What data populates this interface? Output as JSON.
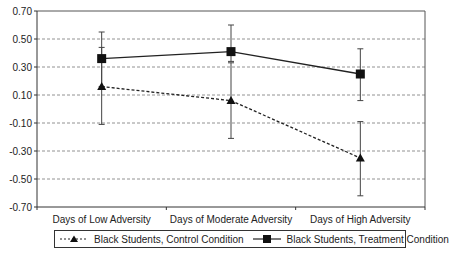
{
  "chart_data": {
    "type": "line",
    "title": "",
    "xlabel": "",
    "ylabel": "",
    "categories": [
      "Days of Low Adversity",
      "Days of Moderate Adversity",
      "Days of High Adversity"
    ],
    "ylim": [
      -0.7,
      0.7
    ],
    "yticks": [
      "0.70",
      "0.50",
      "0.30",
      "0.10",
      "-0.10",
      "-0.30",
      "-0.50",
      "-0.70"
    ],
    "ytick_values": [
      0.7,
      0.5,
      0.3,
      0.1,
      -0.1,
      -0.3,
      -0.5,
      -0.7
    ],
    "grid": "horizontal dashed",
    "legend_position": "bottom",
    "series": [
      {
        "name": "Black Students, Control Condition",
        "marker": "triangle",
        "line": "dashed",
        "values": [
          0.16,
          0.06,
          -0.35
        ],
        "error_upper": [
          0.44,
          0.33,
          -0.09
        ],
        "error_lower": [
          -0.11,
          -0.21,
          -0.62
        ]
      },
      {
        "name": "Black Students, Treatment Condition",
        "marker": "square",
        "line": "solid",
        "values": [
          0.36,
          0.41,
          0.25
        ],
        "error_upper": [
          0.55,
          0.6,
          0.43
        ],
        "error_lower": [
          0.16,
          0.34,
          0.06
        ]
      }
    ]
  },
  "legend": {
    "control_label": "Black Students, Control Condition",
    "treatment_label": "Black Students, Treatment Condition"
  }
}
